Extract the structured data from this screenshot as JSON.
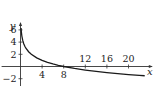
{
  "chart_data": {
    "type": "line",
    "title": "",
    "xlabel": "x",
    "ylabel": "y",
    "xlim": [
      -3.5,
      24.5
    ],
    "ylim": [
      -3.2,
      7.3
    ],
    "x_ticks": [
      4,
      8,
      12,
      16,
      20
    ],
    "x_tick_labels": [
      "4",
      "8",
      "12",
      "16",
      "20"
    ],
    "y_ticks": [
      -2,
      2,
      4,
      6
    ],
    "y_tick_labels": [
      "−2",
      "2",
      "4",
      "6"
    ],
    "grid": false,
    "legend": "none",
    "series": [
      {
        "name": "y = 3 − log2(x)",
        "x": [
          0.02,
          0.05,
          0.1,
          0.15,
          0.25,
          0.4,
          0.6,
          0.8,
          1,
          1.5,
          2,
          3,
          4,
          5,
          6,
          7,
          8,
          10,
          12,
          14,
          16,
          18,
          20,
          22,
          23
        ],
        "y": [
          8.64,
          7.32,
          6.32,
          5.74,
          5.0,
          4.32,
          3.74,
          3.32,
          3.0,
          2.42,
          2.0,
          1.42,
          1.0,
          0.68,
          0.42,
          0.19,
          0.0,
          -0.32,
          -0.58,
          -0.81,
          -1.0,
          -1.17,
          -1.32,
          -1.46,
          -1.52
        ]
      }
    ]
  }
}
